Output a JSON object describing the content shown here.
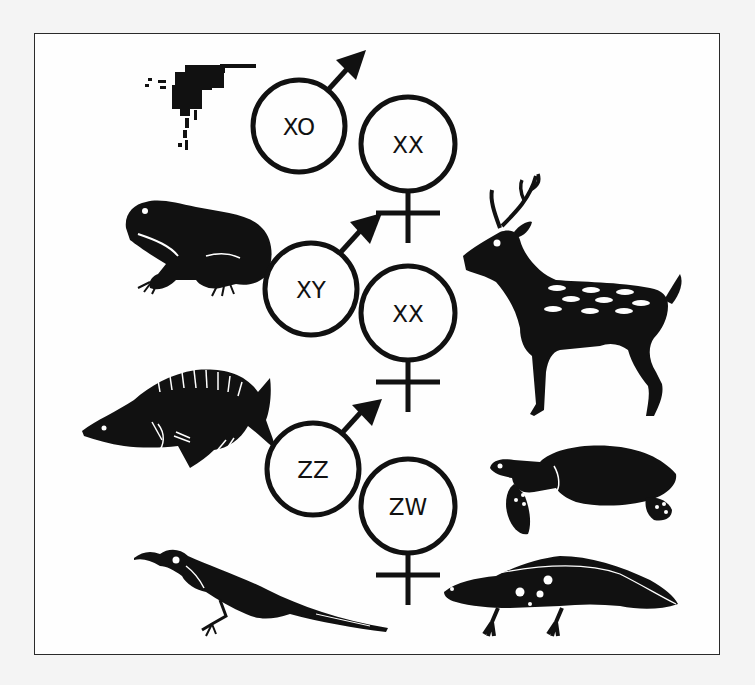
{
  "figure": {
    "colors": {
      "ink": "#111111",
      "frame": "#2a2a2a",
      "paper": "#fefefe",
      "background": "#f4f4f4"
    },
    "systems": [
      {
        "id": "xo",
        "animals": [
          "insect"
        ],
        "male": {
          "label": "XO",
          "symbol": "male-symbol"
        },
        "female": {
          "label": "XX",
          "symbol": "female-symbol"
        }
      },
      {
        "id": "xy",
        "animals": [
          "frog",
          "deer"
        ],
        "male": {
          "label": "XY",
          "symbol": "male-symbol"
        },
        "female": {
          "label": "XX",
          "symbol": "female-symbol"
        }
      },
      {
        "id": "zw",
        "animals": [
          "fish",
          "bird",
          "turtle",
          "salamander"
        ],
        "male": {
          "label": "ZZ",
          "symbol": "male-symbol"
        },
        "female": {
          "label": "ZW",
          "symbol": "female-symbol"
        }
      }
    ]
  }
}
